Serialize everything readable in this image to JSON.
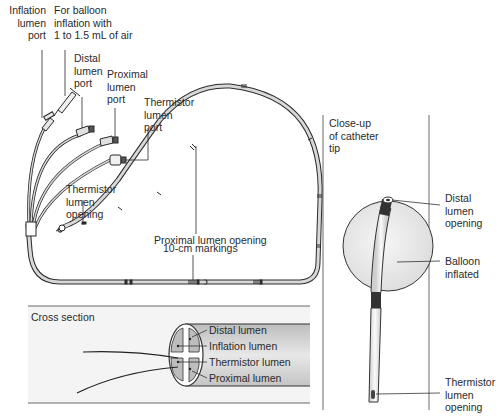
{
  "main_view": {
    "labels": {
      "inflation_port": "Inflation\nlumen\nport",
      "balloon_inflation": "For balloon\ninflation with\n1 to 1.5 mL of air",
      "distal_port": "Distal\nlumen\nport",
      "proximal_port": "Proximal\nlumen\nport",
      "thermistor_port": "Thermistor\nlumen\nport",
      "thermistor_opening": "Thermistor\nlumen\nopening",
      "proximal_opening": "Proximal lumen opening",
      "markings": "10-cm markings"
    }
  },
  "closeup": {
    "title": "Close-up\nof catheter\ntip",
    "labels": {
      "distal_opening": "Distal\nlumen\nopening",
      "balloon": "Balloon\ninflated",
      "thermistor_opening": "Thermistor\nlumen\nopening"
    }
  },
  "cross_section": {
    "title": "Cross section",
    "lumens": [
      "Distal lumen",
      "Inflation lumen",
      "Thermistor lumen",
      "Proximal lumen"
    ]
  },
  "colors": {
    "line": "#2a2a2a",
    "tube_fill": "#d8d8d8",
    "panel_fill": "#f2f2f2",
    "balloon_fill": "#ececec",
    "dark_band": "#3a3a3a"
  }
}
